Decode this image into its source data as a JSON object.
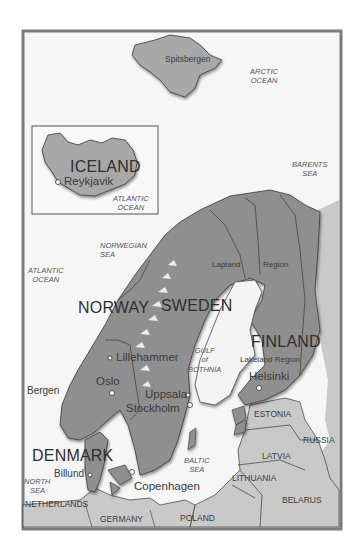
{
  "map": {
    "colors": {
      "background": "#ffffff",
      "frame": "#7a7a7a",
      "sea": "#f4f4f4",
      "nordic_land": "#8f8f8f",
      "other_land": "#c9c9c9",
      "border_line": "#3a3a3a",
      "mountains": "#f2f2f2"
    },
    "insets": [
      {
        "name": "Iceland inset",
        "country": "ICELAND",
        "city": "Reykjavik",
        "water": [
          "ATLANTIC",
          "OCEAN"
        ]
      }
    ],
    "countries_major": {
      "norway": "NORWAY",
      "sweden": "SWEDEN",
      "finland": "FINLAND",
      "denmark": "DENMARK",
      "iceland": "ICELAND"
    },
    "countries_minor": {
      "estonia": "ESTONIA",
      "russia": "RUSSIA",
      "latvia": "LATVIA",
      "lithuania": "LITHUANIA",
      "belarus": "BELARUS",
      "netherlands": "NETHERLANDS",
      "germany": "GERMANY",
      "poland": "POLAND"
    },
    "regions": {
      "lapland": "Lapland",
      "region": "Region",
      "lakeland": "Lakeland Region"
    },
    "islands": {
      "spitsbergen": "Spitsbergen"
    },
    "cities": {
      "reykjavik": "Reykjavik",
      "lillehammer": "Lillehammer",
      "oslo": "Oslo",
      "bergen": "Bergen",
      "uppsala": "Uppsala",
      "stockholm": "Stockholm",
      "helsinki": "Helsinki",
      "billund": "Billund",
      "copenhagen": "Copenhagen"
    },
    "waters": {
      "arctic": [
        "ARCTIC",
        "OCEAN"
      ],
      "barents": [
        "BARENTS",
        "SEA"
      ],
      "atlantic_inset": [
        "ATLANTIC",
        "OCEAN"
      ],
      "norwegian": [
        "NORWEGIAN",
        "SEA"
      ],
      "atlantic": [
        "ATLANTIC",
        "OCEAN"
      ],
      "gulf": [
        "GULF",
        "of",
        "BOTHNIA"
      ],
      "baltic": [
        "BALTIC",
        "SEA"
      ],
      "north": [
        "NORTH",
        "SEA"
      ]
    }
  }
}
